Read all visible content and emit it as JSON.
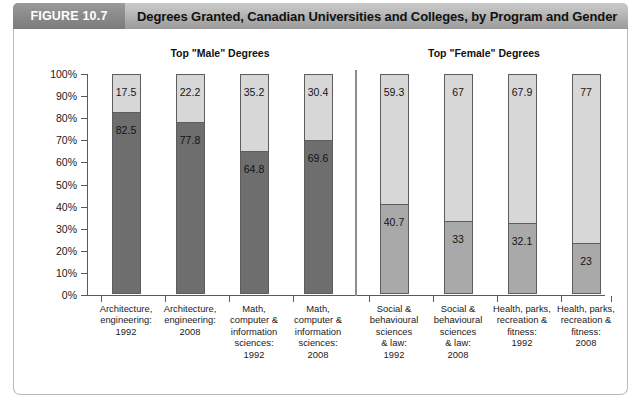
{
  "header": {
    "figure_number": "FIGURE 10.7",
    "title": "Degrees Granted, Canadian Universities and Colleges, by Program and Gender"
  },
  "colors": {
    "male_dark": "#6e6e6e",
    "male_medium": "#a9a9a9",
    "female_light": "#d7d7d7",
    "bar_border": "#5d5d5d",
    "axis": "#5a5a5a",
    "header_bar": "#b5b5b5",
    "figure_box": "#8a8a8a"
  },
  "groups": [
    {
      "id": "male",
      "label": "Top \"Male\" Degrees"
    },
    {
      "id": "female",
      "label": "Top \"Female\" Degrees"
    }
  ],
  "chart_data": {
    "type": "bar",
    "subtype": "stacked-100-percent",
    "title": "Degrees Granted, Canadian Universities and Colleges, by Program and Gender",
    "xlabel": "",
    "ylabel": "",
    "ylim": [
      0,
      100
    ],
    "ytick_labels": [
      "0%",
      "10%",
      "20%",
      "30%",
      "40%",
      "50%",
      "60%",
      "70%",
      "80%",
      "90%",
      "100%"
    ],
    "ytick_values": [
      0,
      10,
      20,
      30,
      40,
      50,
      60,
      70,
      80,
      90,
      100
    ],
    "grid": false,
    "legend": "none",
    "categories": [
      "Architecture, engineering: 1992",
      "Architecture, engineering: 2008",
      "Math, computer & information sciences: 1992",
      "Math, computer & information sciences: 2008",
      "Social & behavioural sciences & law: 1992",
      "Social & behavioural sciences & law: 2008",
      "Health, parks, recreation & fitness: 1992",
      "Health, parks, recreation & fitness: 2008"
    ],
    "category_lines": [
      [
        "Architecture,",
        "engineering:",
        "1992"
      ],
      [
        "Architecture,",
        "engineering:",
        "2008"
      ],
      [
        "Math,",
        "computer &",
        "information",
        "sciences:",
        "1992"
      ],
      [
        "Math,",
        "computer &",
        "information",
        "sciences:",
        "2008"
      ],
      [
        "Social &",
        "behavioural",
        "sciences",
        "& law:",
        "1992"
      ],
      [
        "Social &",
        "behavioural",
        "sciences",
        "& law:",
        "2008"
      ],
      [
        "Health, parks,",
        "recreation &",
        "fitness:",
        "1992"
      ],
      [
        "Health, parks,",
        "recreation &",
        "fitness:",
        "2008"
      ]
    ],
    "series": [
      {
        "name": "Male (lower segment)",
        "values": [
          82.5,
          77.8,
          64.8,
          69.6,
          40.7,
          33,
          32.1,
          23
        ],
        "labels": [
          "82.5",
          "77.8",
          "64.8",
          "69.6",
          "40.7",
          "33",
          "32.1",
          "23"
        ]
      },
      {
        "name": "Female (upper segment)",
        "values": [
          17.5,
          22.2,
          35.2,
          30.4,
          59.3,
          67,
          67.9,
          77
        ],
        "labels": [
          "17.5",
          "22.2",
          "35.2",
          "30.4",
          "59.3",
          "67",
          "67.9",
          "77"
        ]
      }
    ],
    "group_assignment": [
      "male",
      "male",
      "male",
      "male",
      "female",
      "female",
      "female",
      "female"
    ]
  }
}
